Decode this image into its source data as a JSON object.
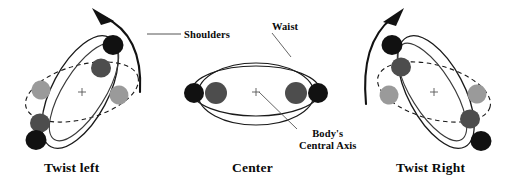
{
  "figure": {
    "width": 510,
    "height": 184,
    "background": "#ffffff"
  },
  "colors": {
    "stroke": "#1a1a1a",
    "dot_black": "#111111",
    "dot_dark_gray": "#4d4d4d",
    "dot_light_gray": "#9a9a9a",
    "leader": "#555555",
    "text": "#0a0a0a"
  },
  "labels": {
    "shoulders": "Shoulders",
    "waist": "Waist",
    "axis_line1": "Body's",
    "axis_line2": "Central Axis"
  },
  "captions": {
    "left": "Twist left",
    "center": "Center",
    "right": "Twist Right"
  },
  "panels": [
    {
      "id": "twist-left",
      "caption": "Twist left",
      "center": [
        82,
        92
      ],
      "shoulder_ellipse": {
        "rx": 62,
        "ry": 27,
        "rotation": -62,
        "style": "solid"
      },
      "waist_ellipse": {
        "rx": 58,
        "ry": 27,
        "rotation": -15,
        "style": "dashed"
      },
      "rotation_arrow": "counter-clockwise-up-left",
      "markers": [
        {
          "kind": "shoulder",
          "color": "dot_black",
          "pos": [
            113,
            45
          ]
        },
        {
          "kind": "shoulder",
          "color": "dot_dark_gray",
          "pos": [
            101,
            68
          ]
        },
        {
          "kind": "waist",
          "color": "dot_light_gray",
          "pos": [
            119,
            95
          ]
        },
        {
          "kind": "waist",
          "color": "dot_light_gray",
          "pos": [
            41,
            90
          ]
        },
        {
          "kind": "shoulder",
          "color": "dot_dark_gray",
          "pos": [
            40,
            123
          ]
        },
        {
          "kind": "shoulder",
          "color": "dot_black",
          "pos": [
            36,
            140
          ]
        }
      ]
    },
    {
      "id": "center",
      "caption": "Center",
      "center": [
        256,
        92
      ],
      "shoulder_ellipse": {
        "rx": 64,
        "ry": 24,
        "rotation": 0,
        "style": "solid"
      },
      "waist_ellipse": {
        "rx": 58,
        "ry": 30,
        "rotation": 0,
        "style": "solid"
      },
      "rotation_arrow": "none",
      "markers": [
        {
          "kind": "shoulder",
          "color": "dot_black",
          "pos": [
            194,
            93
          ]
        },
        {
          "kind": "waist",
          "color": "dot_dark_gray",
          "pos": [
            215,
            93
          ]
        },
        {
          "kind": "waist",
          "color": "dot_dark_gray",
          "pos": [
            296,
            93
          ]
        },
        {
          "kind": "shoulder",
          "color": "dot_black",
          "pos": [
            317,
            93
          ]
        }
      ]
    },
    {
      "id": "twist-right",
      "caption": "Twist Right",
      "center": [
        434,
        92
      ],
      "shoulder_ellipse": {
        "rx": 62,
        "ry": 27,
        "rotation": 62,
        "style": "solid"
      },
      "waist_ellipse": {
        "rx": 58,
        "ry": 27,
        "rotation": 15,
        "style": "dashed"
      },
      "rotation_arrow": "clockwise-up-right",
      "markers": [
        {
          "kind": "shoulder",
          "color": "dot_black",
          "pos": [
            392,
            45
          ]
        },
        {
          "kind": "shoulder",
          "color": "dot_dark_gray",
          "pos": [
            400,
            67
          ]
        },
        {
          "kind": "waist",
          "color": "dot_light_gray",
          "pos": [
            389,
            95
          ]
        },
        {
          "kind": "waist",
          "color": "dot_light_gray",
          "pos": [
            477,
            94
          ]
        },
        {
          "kind": "shoulder",
          "color": "dot_dark_gray",
          "pos": [
            470,
            119
          ]
        },
        {
          "kind": "shoulder",
          "color": "dot_black",
          "pos": [
            481,
            141
          ]
        }
      ]
    }
  ],
  "leaders": [
    {
      "name": "shoulders-leader",
      "from": [
        180,
        34
      ],
      "to": [
        148,
        34
      ]
    },
    {
      "name": "waist-leader",
      "from": [
        272,
        32
      ],
      "to": [
        290,
        55
      ]
    },
    {
      "name": "axis-leader",
      "from": [
        297,
        130
      ],
      "to": [
        258,
        91
      ]
    }
  ]
}
